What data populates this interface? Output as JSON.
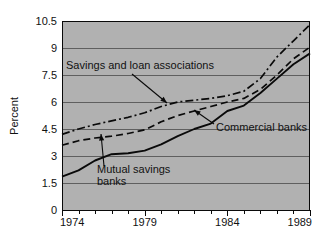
{
  "chart_data": {
    "type": "line",
    "title": "",
    "subtitle": "",
    "xlabel": "",
    "ylabel": "Percent",
    "xlim": [
      1974,
      1989
    ],
    "ylim": [
      0,
      10.5
    ],
    "grid": true,
    "legend_position": "inline-annotations",
    "x_tick_labels": [
      "1974",
      "1979",
      "1984",
      "1989"
    ],
    "x_tick_values": [
      1974,
      1979,
      1984,
      1989
    ],
    "x_minor_ticks": [
      1975,
      1976,
      1977,
      1978,
      1980,
      1981,
      1982,
      1983,
      1985,
      1986,
      1987,
      1988
    ],
    "y_tick_labels": [
      "0",
      "1.5",
      "3",
      "4.5",
      "6",
      "7.5",
      "9",
      "10.5"
    ],
    "y_tick_values": [
      0,
      1.5,
      3,
      4.5,
      6,
      7.5,
      9,
      10.5
    ],
    "x": [
      1974,
      1975,
      1976,
      1977,
      1978,
      1979,
      1980,
      1981,
      1982,
      1983,
      1984,
      1985,
      1986,
      1987,
      1988,
      1989
    ],
    "series": [
      {
        "name": "Savings and loan associations",
        "style": "dash-dot",
        "values": [
          4.2,
          4.5,
          4.75,
          4.95,
          5.15,
          5.4,
          5.75,
          6.0,
          6.1,
          6.2,
          6.35,
          6.6,
          7.3,
          8.5,
          9.4,
          10.3
        ]
      },
      {
        "name": "Commercial banks",
        "style": "dashed",
        "values": [
          3.6,
          3.85,
          4.0,
          4.1,
          4.25,
          4.45,
          4.9,
          5.25,
          5.5,
          5.75,
          6.0,
          6.2,
          6.7,
          7.5,
          8.4,
          9.05
        ]
      },
      {
        "name": "Mutual savings banks",
        "style": "solid",
        "values": [
          1.85,
          2.2,
          2.75,
          3.1,
          3.15,
          3.3,
          3.65,
          4.1,
          4.5,
          4.8,
          5.5,
          5.8,
          6.5,
          7.3,
          8.1,
          8.7
        ]
      }
    ],
    "annotations": [
      {
        "id": "savings-and-loan-annotation",
        "text": "Savings and loan associations",
        "text_line1": "Savings and loan associations",
        "label_x": 66,
        "label_y": 69,
        "arrow_from_x": 132,
        "arrow_from_y": 74,
        "arrow_to_x": 167,
        "arrow_to_y": 103
      },
      {
        "id": "commercial-banks-annotation",
        "text": "Commercial banks",
        "text_line1": "Commercial banks",
        "label_x": 216,
        "label_y": 131,
        "arrow_from_x": 214,
        "arrow_from_y": 124,
        "arrow_to_x": 194,
        "arrow_to_y": 110
      },
      {
        "id": "mutual-savings-banks-annotation",
        "text": "Mutual savings banks",
        "text_line1": "Mutual savings",
        "text_line2": "banks",
        "label_x": 97,
        "label_y": 173,
        "label_y2": 185,
        "arrow_from_x": 104,
        "arrow_from_y": 166,
        "arrow_to_x": 101,
        "arrow_to_y": 134
      }
    ],
    "colors": {
      "plot_background": "#b1b1b1",
      "figure_background": "#ffffff",
      "line": "#0a0a0a",
      "gridline": "#5f5f5f",
      "axis": "#0a0a0a",
      "text": "#111111"
    }
  }
}
